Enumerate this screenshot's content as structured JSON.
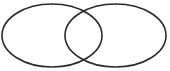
{
  "diagram": {
    "type": "venn",
    "stroke_color": "#2a2a2a",
    "background": "#ffffff",
    "sets": [
      {
        "name": "set-a",
        "cx": 52,
        "cy": 35.5,
        "rx": 50,
        "ry": 31.5
      },
      {
        "name": "set-b",
        "cx": 115.5,
        "cy": 35.5,
        "rx": 50.5,
        "ry": 31.5
      }
    ]
  }
}
